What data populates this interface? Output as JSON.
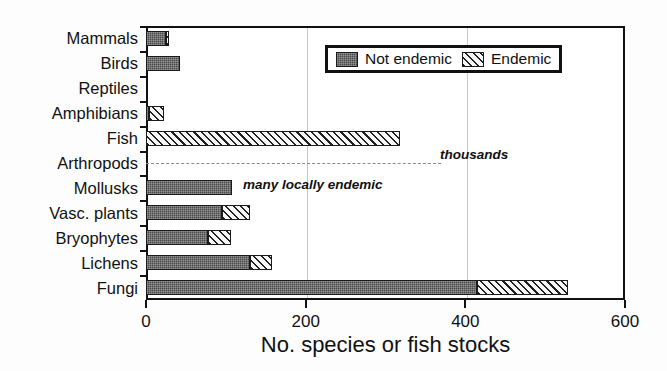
{
  "chart_data": {
    "type": "bar",
    "orientation": "horizontal",
    "stacked": true,
    "title": "",
    "xlabel": "No. species or fish stocks",
    "ylabel": "",
    "xlim": [
      0,
      600
    ],
    "xticks": [
      0,
      200,
      400,
      600
    ],
    "xticklabels": [
      "0",
      "200",
      "400",
      "600"
    ],
    "grid": "vertical",
    "legend_position": "top-right",
    "categories": [
      "Mammals",
      "Birds",
      "Reptiles",
      "Amphibians",
      "Fish",
      "Arthropods",
      "Mollusks",
      "Vasc. plants",
      "Bryophytes",
      "Lichens",
      "Fungi"
    ],
    "series": [
      {
        "name": "Not endemic",
        "color": "#4a4a4a",
        "pattern": "dense-dotted",
        "values": [
          25,
          43,
          0,
          4,
          0,
          0,
          108,
          95,
          78,
          130,
          415
        ]
      },
      {
        "name": "Endemic",
        "color": "#f2f2f2",
        "pattern": "diagonal-hatch",
        "values": [
          4,
          0,
          0,
          18,
          318,
          0,
          0,
          35,
          28,
          28,
          114
        ]
      }
    ],
    "totals": [
      29,
      43,
      0,
      22,
      318,
      0,
      108,
      130,
      106,
      158,
      529
    ],
    "annotations": [
      {
        "text": "thousands",
        "category": "Arthropods",
        "style": "bold-italic",
        "note": "dashed line spanning plot with off-scale label"
      },
      {
        "text": "many locally endemic",
        "category": "Mollusks",
        "style": "bold-italic",
        "note": "label to the right of the Mollusks bar"
      }
    ]
  },
  "legend": {
    "entries": [
      {
        "label": "Not endemic"
      },
      {
        "label": "Endemic"
      }
    ]
  },
  "axis": {
    "x_title": "No. species or fish stocks",
    "tick_0": "0",
    "tick_200": "200",
    "tick_400": "400",
    "tick_600": "600"
  },
  "labels": {
    "mammals": "Mammals",
    "birds": "Birds",
    "reptiles": "Reptiles",
    "amphibians": "Amphibians",
    "fish": "Fish",
    "arthropods": "Arthropods",
    "mollusks": "Mollusks",
    "vasc_plants": "Vasc. plants",
    "bryophytes": "Bryophytes",
    "lichens": "Lichens",
    "fungi": "Fungi"
  },
  "annotations": {
    "thousands": "thousands",
    "many_locally_endemic": "many locally endemic"
  }
}
